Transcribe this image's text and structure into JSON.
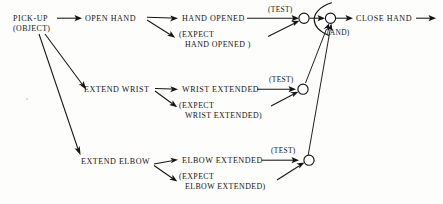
{
  "diagram": {
    "type": "flowchart",
    "ink_color": "#151515",
    "background_color": "#fdfdfc",
    "nodes": {
      "start": {
        "line1": "PICK-UP",
        "line2": "(OBJECT)"
      },
      "actions": [
        {
          "label": "OPEN HAND"
        },
        {
          "label": "EXTEND WRIST"
        },
        {
          "label": "EXTEND ELBOW"
        }
      ],
      "results": [
        {
          "label": "HAND OPENED"
        },
        {
          "label": "WRIST EXTENDED"
        },
        {
          "label": "ELBOW EXTENDED"
        }
      ],
      "expectations": [
        {
          "line1": "(EXPECT",
          "line2": "HAND OPENED )"
        },
        {
          "line1": "(EXPECT",
          "line2": "WRIST EXTENDED)"
        },
        {
          "line1": "(EXPECT",
          "line2": "ELBOW EXTENDED)"
        }
      ],
      "tests": [
        {
          "label": "(TEST)"
        },
        {
          "label": "(TEST)"
        },
        {
          "label": "(TEST)"
        }
      ],
      "junction": {
        "label": "(AND)"
      },
      "output": {
        "label": "CLOSE HAND"
      }
    }
  }
}
